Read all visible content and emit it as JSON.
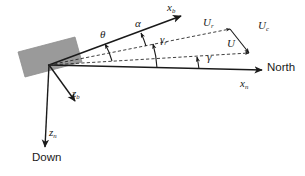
{
  "figure": {
    "kind": "vector-kinematics-diagram",
    "background_color": "#ffffff",
    "line_color": "#1a1a1a",
    "body_fill": "#9a9a9a",
    "body_stroke": "#8a8a8a"
  },
  "axes": {
    "body_x": {
      "symbol": "x",
      "subscript": "b"
    },
    "body_z": {
      "symbol": "z",
      "subscript": "b"
    },
    "ned_x": {
      "symbol": "x",
      "subscript": "n"
    },
    "ned_z": {
      "symbol": "z",
      "subscript": "n"
    },
    "north_label": "North",
    "down_label": "Down"
  },
  "angles": {
    "theta": {
      "symbol": "θ",
      "name": "pitch-angle"
    },
    "alpha": {
      "symbol": "α",
      "name": "angle-of-attack"
    },
    "gamma_r": {
      "symbol": "γ",
      "subscript": "r",
      "name": "relative-flight-path-angle"
    },
    "gamma": {
      "symbol": "γ",
      "subscript": "",
      "name": "flight-path-angle"
    }
  },
  "vectors": {
    "relative_velocity": {
      "symbol": "U",
      "subscript": "r",
      "style": "dashed"
    },
    "current_velocity": {
      "symbol": "U",
      "subscript": "c",
      "style": "solid"
    },
    "total_velocity": {
      "symbol": "U",
      "subscript": "",
      "style": "dashed"
    }
  }
}
